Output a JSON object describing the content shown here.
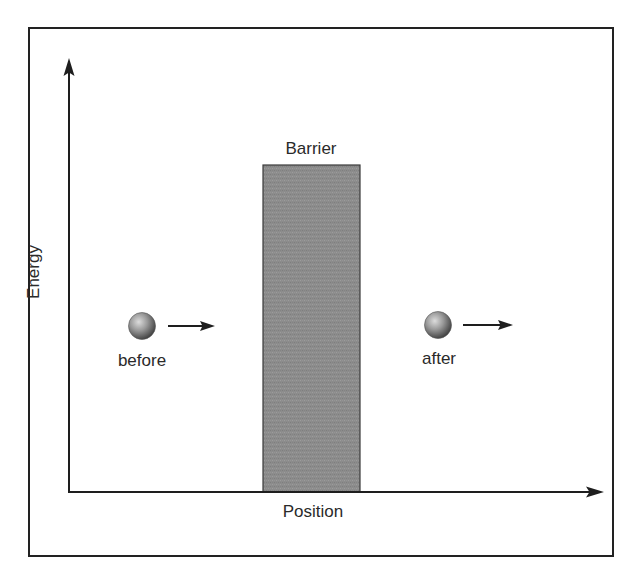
{
  "diagram": {
    "type": "quantum-tunneling-barrier",
    "colors": {
      "background": "#ffffff",
      "frame": "#222222",
      "axis": "#1e1e1e",
      "barrier_fill": "#8c8c8c",
      "barrier_stroke": "#3a3a3a",
      "particle_light": "#d8d8d8",
      "particle_mid": "#8a8a8a",
      "particle_dark": "#3c3c3c",
      "text": "#2a2a2a"
    },
    "axes": {
      "x_label": "Position",
      "y_label": "Energy"
    },
    "barrier": {
      "label": "Barrier"
    },
    "particles": [
      {
        "id": "before",
        "label": "before",
        "direction": "right"
      },
      {
        "id": "after",
        "label": "after",
        "direction": "right"
      }
    ]
  }
}
